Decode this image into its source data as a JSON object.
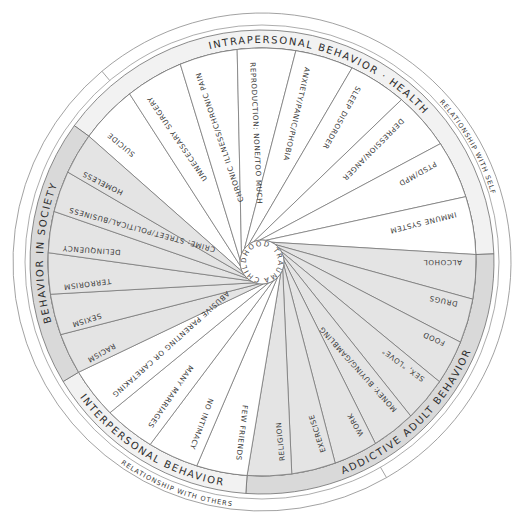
{
  "diagram": {
    "hub": {
      "label": "CHILDHOOD TRAUMA & NEGLECT"
    },
    "colors": {
      "light": "#ffffff",
      "shaded": "#e4e4e4",
      "ring_shaded": "#d9d9d9",
      "line": "#6f6f6f",
      "text": "#333333"
    },
    "sections": [
      {
        "name": "intrapersonal",
        "label": "INTRAPERSONAL BEHAVIOR · HEALTH",
        "shaded": false,
        "items": [
          "SUICIDE",
          "UNNECESSARY SURGERY",
          "CHRONIC ILLNESS/CHRONIC PAIN",
          "REPRODUCTION: NONE/TOO MUCH",
          "ANXIETY/PANIC/PHOBIA",
          "SLEEP DISORDER",
          "DEPRESSION/ANGER",
          "PTSD/MPD",
          "IMMUNE SYSTEM"
        ]
      },
      {
        "name": "addictive",
        "label": "ADDICTIVE ADULT BEHAVIOR",
        "shaded": true,
        "items": [
          "ALCOHOL",
          "DRUGS",
          "FOOD",
          "SEX, \"LOVE\"",
          "MONEY: BUYING/GAMBLING",
          "WORK",
          "EXERCISE",
          "RELIGION"
        ]
      },
      {
        "name": "interpersonal",
        "label": "INTERPERSONAL BEHAVIOR",
        "shaded": false,
        "items": [
          "FEW FRIENDS",
          "NO INTIMACY",
          "MANY MARRIAGES",
          "ABUSIVE PARENTING OR CARETAKING"
        ]
      },
      {
        "name": "society",
        "label": "BEHAVIOR IN SOCIETY",
        "shaded": true,
        "items": [
          "RACISM",
          "SEXISM",
          "TERRORISM",
          "DELINQUENCY",
          "CRIME: STREET/POLITICAL/BUSINESS",
          "HOMELESS"
        ]
      }
    ],
    "relationships": [
      {
        "name": "self",
        "label": "RELATIONSHIP WITH SELF"
      },
      {
        "name": "others",
        "label": "RELATIONSHIP WITH OTHERS"
      }
    ]
  }
}
